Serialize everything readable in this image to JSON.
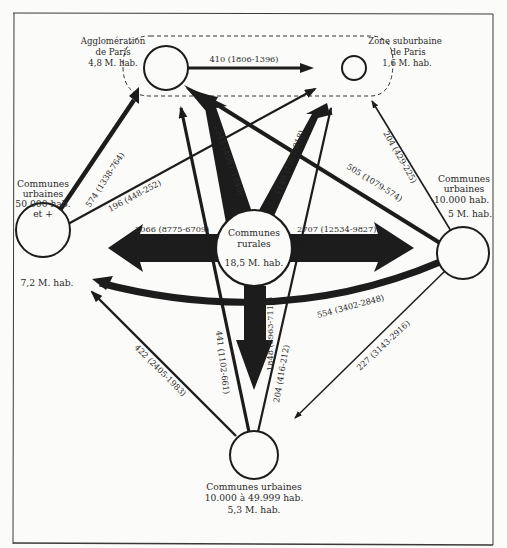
{
  "nodes": {
    "paris": {
      "line1": "Agglomération",
      "line2": "de Paris",
      "line3": "4,8 M. hab."
    },
    "suburb": {
      "line1": "Zone suburbaine",
      "line2": "de Paris",
      "line3": "1,6 M. hab."
    },
    "big_cities": {
      "line1": "Communes",
      "line2": "urbaines",
      "line3": "50.000 hab.",
      "line4": "et +",
      "pop": "7,2 M. hab."
    },
    "rural": {
      "line1": "Communes",
      "line2": "rurales",
      "pop": "18,5 M. hab."
    },
    "small_towns": {
      "line1": "Communes",
      "line2": "urbaines",
      "line3": "-10.000 hab.",
      "pop": "5 M. hab."
    },
    "mid_towns": {
      "line1": "Communes urbaines",
      "line2": "10.000 à 49.999 hab.",
      "pop": "5,3 M. hab."
    }
  },
  "flows": [
    {
      "id": "paris_to_suburb",
      "label": "410 (1806-1396)"
    },
    {
      "id": "rural_to_paris",
      "label": "2241 (4081-1840)"
    },
    {
      "id": "rural_to_suburb",
      "label": "1149 (1967-818)"
    },
    {
      "id": "big_to_paris",
      "label": "574 (1338-764)"
    },
    {
      "id": "big_to_suburb",
      "label": "196 (448-252)"
    },
    {
      "id": "small_to_paris",
      "label": "505 (1079-574)"
    },
    {
      "id": "small_to_suburb",
      "label": "204 (429-225)"
    },
    {
      "id": "rural_to_big",
      "label": "2066 (8775-6709)"
    },
    {
      "id": "rural_to_small",
      "label": "2707 (12534-9827)"
    },
    {
      "id": "small_to_big",
      "label": "554 (3402-2848)"
    },
    {
      "id": "rural_to_mid",
      "label": "1848 (8963-7115)"
    },
    {
      "id": "mid_to_paris",
      "label": "441 (1102-661)"
    },
    {
      "id": "mid_to_suburb",
      "label": "204 (416-212)"
    },
    {
      "id": "mid_to_big",
      "label": "422 (2405-1983)"
    },
    {
      "id": "small_to_mid",
      "label": "227 (3143-2916)"
    }
  ],
  "colors": {
    "ink": "#1c1c1c",
    "paper": "#fbfbf9",
    "frame": "#3a3a3a"
  }
}
